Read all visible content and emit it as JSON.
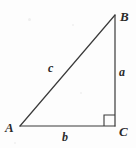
{
  "figure": {
    "kind": "right-triangle-diagram",
    "background_color": "#fdfdfd",
    "stroke_color": "#3a3a3a",
    "label_color": "#2b2b2b",
    "vertices": [
      {
        "name": "A",
        "label": "A",
        "x": 20,
        "y": 126
      },
      {
        "name": "B",
        "label": "B",
        "x": 115,
        "y": 15
      },
      {
        "name": "C",
        "label": "C",
        "x": 115,
        "y": 126
      }
    ],
    "sides": [
      {
        "name": "a",
        "label": "a",
        "from": "B",
        "to": "C",
        "role": "opposite-leg-vertical"
      },
      {
        "name": "b",
        "label": "b",
        "from": "A",
        "to": "C",
        "role": "adjacent-leg-horizontal"
      },
      {
        "name": "c",
        "label": "c",
        "from": "A",
        "to": "B",
        "role": "hypotenuse"
      }
    ],
    "right_angle": {
      "at_vertex": "C",
      "marker": "square",
      "size": 11
    }
  }
}
